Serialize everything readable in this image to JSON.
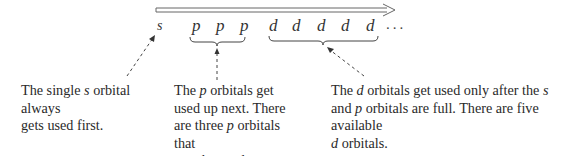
{
  "diagram": {
    "direction_arrow": {
      "style": "hollow-double-line",
      "from_x": 156,
      "to_x": 393,
      "y": 10
    },
    "sequence": [
      {
        "label": "s",
        "group": "s"
      },
      {
        "label": "p",
        "group": "p"
      },
      {
        "label": "p",
        "group": "p"
      },
      {
        "label": "p",
        "group": "p"
      },
      {
        "label": "d",
        "group": "d"
      },
      {
        "label": "d",
        "group": "d"
      },
      {
        "label": "d",
        "group": "d"
      },
      {
        "label": "d",
        "group": "d"
      },
      {
        "label": "d",
        "group": "d"
      }
    ],
    "ellipsis": "...",
    "captions": {
      "s": {
        "line1_pre": "The single ",
        "line1_em": "s",
        "line1_post": " orbital always",
        "line2": "gets used first."
      },
      "p": {
        "line1_pre": "The ",
        "line1_em": "p",
        "line1_post": " orbitals get",
        "line2": "used up next. There",
        "line3_pre": "are three ",
        "line3_em": "p",
        "line3_post": " orbitals that",
        "line4": "may be used."
      },
      "d": {
        "line1_pre": "The ",
        "line1_em": "d",
        "line1_mid": " orbitals get used only after the ",
        "line1_em2": "s",
        "line2_pre": "and ",
        "line2_em": "p",
        "line2_post": " orbitals are full. There are five available",
        "line3_em": "d",
        "line3_post": " orbitals."
      }
    },
    "colors": {
      "text": "#2a2a2a",
      "arrow_stroke": "#555555",
      "dashed_arrow": "#444444"
    }
  }
}
